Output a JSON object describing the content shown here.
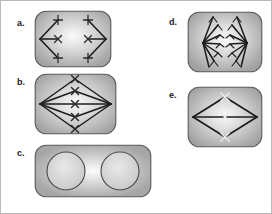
{
  "figure": {
    "background_color": "#ffffff",
    "border_color": "#b9b9b9",
    "width": 272,
    "height": 214
  },
  "style": {
    "cell_fill_outer": "#a9a9a9",
    "cell_fill_inner": "#f2f2f2",
    "cell_stroke": "#5a5a5a",
    "spindle_color": "#1c1c1c",
    "chromosome_color": "#2a2a2a",
    "nucleus_fill": "#d8d8d8",
    "nucleus_stroke": "#4a4a4a",
    "label_color": "#1a1a1a"
  },
  "panels": [
    {
      "id": "a",
      "label": "a.",
      "label_x": 16,
      "label_y": 18,
      "cell_x": 33,
      "cell_y": 9,
      "cell_w": 78,
      "cell_h": 58,
      "shape": "rounded-rect",
      "corner_radius": 11,
      "description": "Anaphase: sister chromatids separated and pulled toward opposite spindle poles",
      "pole_left": {
        "x": 6,
        "y": 29
      },
      "pole_right": {
        "x": 72,
        "y": 29
      },
      "chromosome_marks": [
        {
          "x": 24,
          "y": 10,
          "glyph": "cross"
        },
        {
          "x": 24,
          "y": 29,
          "glyph": "x"
        },
        {
          "x": 24,
          "y": 48,
          "glyph": "cross"
        },
        {
          "x": 54,
          "y": 10,
          "glyph": "cross"
        },
        {
          "x": 54,
          "y": 29,
          "glyph": "x"
        },
        {
          "x": 54,
          "y": 48,
          "glyph": "cross"
        }
      ],
      "spindle_fiber_count": 6
    },
    {
      "id": "b",
      "label": "b.",
      "label_x": 16,
      "label_y": 77,
      "cell_x": 33,
      "cell_y": 72,
      "cell_w": 83,
      "cell_h": 62,
      "shape": "rounded-rect",
      "corner_radius": 11,
      "description": "Metaphase: chromosomes aligned along the metaphase plate at cell equator",
      "pole_left": {
        "x": 6,
        "y": 31
      },
      "pole_right": {
        "x": 77,
        "y": 31
      },
      "chromosome_marks": [
        {
          "x": 41,
          "y": 6,
          "glyph": "x"
        },
        {
          "x": 41,
          "y": 18,
          "glyph": "x"
        },
        {
          "x": 41,
          "y": 31,
          "glyph": "x"
        },
        {
          "x": 41,
          "y": 44,
          "glyph": "x"
        },
        {
          "x": 41,
          "y": 56,
          "glyph": "x"
        }
      ],
      "spindle_fiber_count": 10
    },
    {
      "id": "c",
      "label": "c.",
      "label_x": 16,
      "label_y": 148,
      "cell_x": 33,
      "cell_y": 143,
      "cell_w": 118,
      "cell_h": 54,
      "shape": "rounded-rect",
      "corner_radius": 11,
      "description": "Telophase / interphase: two daughter nuclei reformed, no visible spindle",
      "nuclei": [
        {
          "cx": 32,
          "cy": 27,
          "r": 19
        },
        {
          "cx": 86,
          "cy": 27,
          "r": 19
        }
      ]
    },
    {
      "id": "d",
      "label": "d.",
      "label_x": 168,
      "label_y": 17,
      "cell_x": 186,
      "cell_y": 10,
      "cell_w": 76,
      "cell_h": 62,
      "shape": "rounded-rect",
      "corner_radius": 11,
      "description": "Late anaphase: two dense chromosome clusters gathered at opposite poles",
      "pole_left": {
        "x": 16,
        "y": 32
      },
      "pole_right": {
        "x": 60,
        "y": 32
      },
      "cluster_arm_count": 7
    },
    {
      "id": "e",
      "label": "e.",
      "label_x": 168,
      "label_y": 90,
      "cell_x": 186,
      "cell_y": 85,
      "cell_w": 76,
      "cell_h": 62,
      "shape": "rounded-rect",
      "corner_radius": 11,
      "description": "Prometaphase: spindle formed, three X-shaped chromosomes near the equator",
      "pole_left": {
        "x": 6,
        "y": 31
      },
      "pole_right": {
        "x": 70,
        "y": 31
      },
      "chromosome_marks": [
        {
          "x": 38,
          "y": 11,
          "glyph": "x"
        },
        {
          "x": 38,
          "y": 31,
          "glyph": "x"
        },
        {
          "x": 38,
          "y": 51,
          "glyph": "x"
        }
      ]
    }
  ]
}
